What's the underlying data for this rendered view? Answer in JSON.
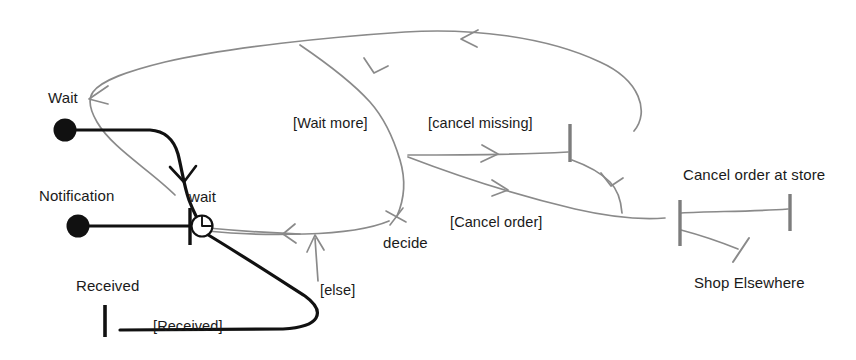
{
  "diagram": {
    "type": "uml-activity-diagram",
    "style": "hand-drawn-sketch",
    "title": "",
    "canvas": {
      "width": 856,
      "height": 360,
      "background": "#ffffff"
    },
    "colors": {
      "primary_flow": "#111111",
      "secondary_flow": "#8a8a8a",
      "text": "#1a1a1a",
      "background": "#ffffff"
    },
    "nodes": [
      {
        "id": "wait-initial",
        "kind": "initial-node",
        "label": "Wait",
        "label_x": 48,
        "label_y": 90,
        "x": 65,
        "y": 130,
        "r": 11
      },
      {
        "id": "notification-initial",
        "kind": "initial-node",
        "label": "Notification",
        "label_x": 39,
        "label_y": 188,
        "x": 78,
        "y": 226,
        "r": 11
      },
      {
        "id": "received-bar",
        "kind": "activity-bar",
        "label": "Received",
        "label_x": 76,
        "label_y": 278,
        "x": 105,
        "y1": 305,
        "y2": 337
      },
      {
        "id": "wait-timer",
        "kind": "timer-event",
        "label": "wait",
        "label_x": 189,
        "label_y": 189,
        "x": 196,
        "y": 226
      },
      {
        "id": "decide",
        "kind": "decision-marker",
        "label": "decide",
        "label_x": 383,
        "label_y": 235,
        "x": 396,
        "y": 217
      },
      {
        "id": "cancel-missing-bar",
        "kind": "activity-bar",
        "label": "",
        "x": 570,
        "y1": 124,
        "y2": 162
      },
      {
        "id": "cancel-order-at-store-left-bar",
        "kind": "activity-bar",
        "label": "Cancel order at store",
        "label_x": 683,
        "label_y": 167,
        "x": 680,
        "y1": 200,
        "y2": 246
      },
      {
        "id": "cancel-order-at-store-right-bar",
        "kind": "activity-bar",
        "label": "",
        "x": 790,
        "y1": 194,
        "y2": 231
      },
      {
        "id": "shop-elsewhere-end",
        "kind": "end-tick",
        "label": "Shop Elsewhere",
        "label_x": 694,
        "label_y": 275,
        "x": 742,
        "y": 248
      }
    ],
    "edge_labels": [
      {
        "id": "wait-more",
        "text": "[Wait more]",
        "x": 293,
        "y": 116
      },
      {
        "id": "cancel-missing",
        "text": "[cancel missing]",
        "x": 428,
        "y": 116
      },
      {
        "id": "cancel-order",
        "text": "[Cancel order]",
        "x": 450,
        "y": 215
      },
      {
        "id": "else",
        "text": "[else]",
        "x": 320,
        "y": 283
      },
      {
        "id": "received-guard",
        "text": "[Received]",
        "x": 153,
        "y": 319
      }
    ]
  }
}
